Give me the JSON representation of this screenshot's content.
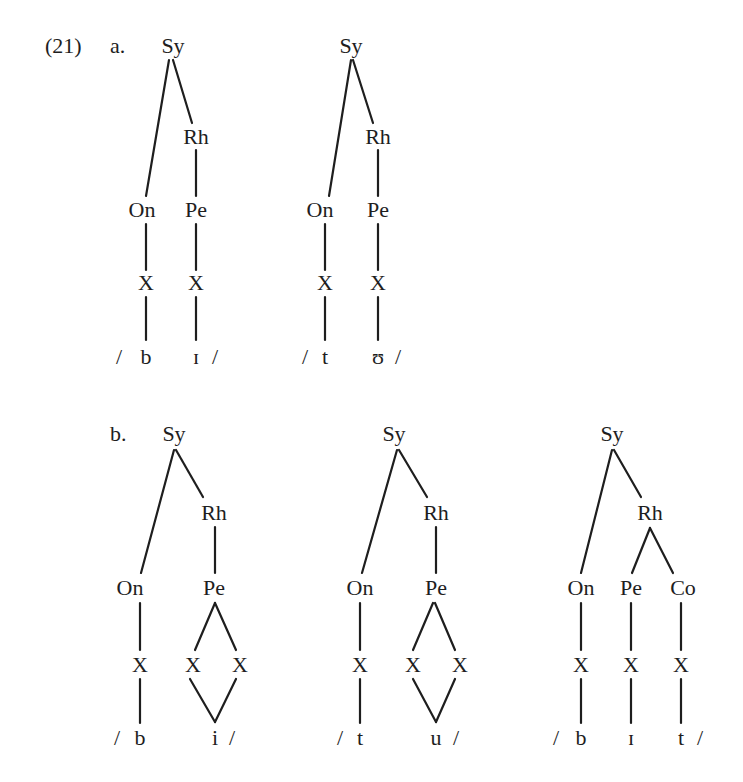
{
  "example": {
    "number": "(21)",
    "parts": [
      {
        "label": "a.",
        "trees": [
          {
            "nodes": [
              {
                "id": "sy",
                "text": "Sy",
                "x": 173,
                "y": 46
              },
              {
                "id": "rh",
                "text": "Rh",
                "x": 196,
                "y": 137
              },
              {
                "id": "on",
                "text": "On",
                "x": 142,
                "y": 210
              },
              {
                "id": "pe",
                "text": "Pe",
                "x": 196,
                "y": 210
              },
              {
                "id": "x1",
                "text": "X",
                "x": 146,
                "y": 283
              },
              {
                "id": "x2",
                "text": "X",
                "x": 196,
                "y": 283
              }
            ],
            "segments": {
              "open": "/",
              "consonant": "b",
              "vowel": "ɪ",
              "close": "/"
            },
            "edges": [
              [
                169,
                60,
                146,
                196
              ],
              [
                173,
                60,
                192,
                123
              ],
              [
                196,
                150,
                196,
                196
              ],
              [
                146,
                224,
                146,
                270
              ],
              [
                196,
                224,
                196,
                270
              ],
              [
                146,
                297,
                146,
                340
              ],
              [
                196,
                297,
                196,
                340
              ]
            ]
          },
          {
            "nodes": [
              {
                "id": "sy",
                "text": "Sy",
                "x": 351,
                "y": 46
              },
              {
                "id": "rh",
                "text": "Rh",
                "x": 378,
                "y": 137
              },
              {
                "id": "on",
                "text": "On",
                "x": 320,
                "y": 210
              },
              {
                "id": "pe",
                "text": "Pe",
                "x": 378,
                "y": 210
              },
              {
                "id": "x1",
                "text": "X",
                "x": 325,
                "y": 283
              },
              {
                "id": "x2",
                "text": "X",
                "x": 378,
                "y": 283
              }
            ],
            "segments": {
              "open": "/",
              "consonant": "t",
              "vowel": "ʊ",
              "close": "/"
            },
            "edges": [
              [
                351,
                60,
                329,
                196
              ],
              [
                353,
                60,
                373,
                123
              ],
              [
                378,
                150,
                378,
                196
              ],
              [
                325,
                224,
                325,
                270
              ],
              [
                378,
                224,
                378,
                270
              ],
              [
                325,
                297,
                325,
                340
              ],
              [
                378,
                297,
                378,
                340
              ]
            ]
          }
        ]
      },
      {
        "label": "b.",
        "trees": [
          {
            "nodes": [
              {
                "id": "sy",
                "text": "Sy",
                "x": 174,
                "y": 434
              },
              {
                "id": "rh",
                "text": "Rh",
                "x": 214,
                "y": 513
              },
              {
                "id": "on",
                "text": "On",
                "x": 130,
                "y": 588
              },
              {
                "id": "pe",
                "text": "Pe",
                "x": 214,
                "y": 588
              },
              {
                "id": "x1",
                "text": "X",
                "x": 140,
                "y": 665
              },
              {
                "id": "x2",
                "text": "X",
                "x": 193,
                "y": 665
              },
              {
                "id": "x3",
                "text": "X",
                "x": 240,
                "y": 665
              }
            ],
            "segments": {
              "open": "/",
              "consonant": "b",
              "vowel": "i",
              "close": "/"
            },
            "edges": [
              [
                174,
                450,
                141,
                573
              ],
              [
                176,
                450,
                203,
                497
              ],
              [
                215,
                527,
                215,
                573
              ],
              [
                140,
                603,
                140,
                650
              ],
              [
                215,
                603,
                195,
                650
              ],
              [
                215,
                603,
                236,
                650
              ],
              [
                140,
                679,
                140,
                723
              ],
              [
                190,
                679,
                215,
                722
              ],
              [
                236,
                679,
                215,
                722
              ]
            ]
          },
          {
            "nodes": [
              {
                "id": "sy",
                "text": "Sy",
                "x": 394,
                "y": 434
              },
              {
                "id": "rh",
                "text": "Rh",
                "x": 436,
                "y": 513
              },
              {
                "id": "on",
                "text": "On",
                "x": 360,
                "y": 588
              },
              {
                "id": "pe",
                "text": "Pe",
                "x": 436,
                "y": 588
              },
              {
                "id": "x1",
                "text": "X",
                "x": 360,
                "y": 665
              },
              {
                "id": "x2",
                "text": "X",
                "x": 413,
                "y": 665
              },
              {
                "id": "x3",
                "text": "X",
                "x": 460,
                "y": 665
              }
            ],
            "segments": {
              "open": "/",
              "consonant": "t",
              "vowel": "u",
              "close": "/"
            },
            "edges": [
              [
                397,
                450,
                362,
                573
              ],
              [
                399,
                450,
                427,
                497
              ],
              [
                436,
                527,
                436,
                573
              ],
              [
                360,
                603,
                360,
                650
              ],
              [
                433,
                603,
                413,
                650
              ],
              [
                435,
                603,
                455,
                650
              ],
              [
                360,
                679,
                360,
                723
              ],
              [
                413,
                679,
                436,
                722
              ],
              [
                455,
                679,
                436,
                722
              ]
            ]
          },
          {
            "nodes": [
              {
                "id": "sy",
                "text": "Sy",
                "x": 612,
                "y": 434
              },
              {
                "id": "rh",
                "text": "Rh",
                "x": 650,
                "y": 513
              },
              {
                "id": "on",
                "text": "On",
                "x": 581,
                "y": 588
              },
              {
                "id": "pe",
                "text": "Pe",
                "x": 631,
                "y": 588
              },
              {
                "id": "co",
                "text": "Co",
                "x": 683,
                "y": 588
              },
              {
                "id": "x1",
                "text": "X",
                "x": 581,
                "y": 665
              },
              {
                "id": "x2",
                "text": "X",
                "x": 631,
                "y": 665
              },
              {
                "id": "x3",
                "text": "X",
                "x": 681,
                "y": 665
              }
            ],
            "segments": {
              "open": "/",
              "consonant": "b",
              "vowel": "ɪ",
              "final": "t",
              "close": "/"
            },
            "edges": [
              [
                612,
                450,
                581,
                573
              ],
              [
                614,
                450,
                641,
                497
              ],
              [
                650,
                528,
                632,
                573
              ],
              [
                650,
                528,
                673,
                573
              ],
              [
                581,
                603,
                581,
                650
              ],
              [
                631,
                603,
                631,
                650
              ],
              [
                681,
                603,
                681,
                650
              ],
              [
                581,
                679,
                581,
                723
              ],
              [
                631,
                679,
                631,
                723
              ],
              [
                681,
                679,
                681,
                723
              ]
            ]
          }
        ]
      }
    ]
  }
}
